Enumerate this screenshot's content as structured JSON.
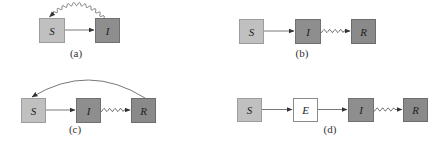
{
  "colors": {
    "susceptible_fill": "#c0c0c0",
    "susceptible_stroke": "#9c9c9c",
    "infected_fill": "#8e8e8e",
    "infected_stroke": "#707070",
    "recovered_fill": "#8a8a8a",
    "recovered_stroke": "#6c6c6c",
    "exposed_fill": "#ffffff",
    "exposed_stroke": "#8a8a8a",
    "edge": "#555555"
  },
  "panels": [
    {
      "id": "a",
      "caption": "(a)",
      "caption_pos": [
        76,
        57
      ],
      "nodes": [
        {
          "id": "S",
          "label": "S",
          "type": "susceptible",
          "x": 39,
          "y": 18,
          "w": 25,
          "h": 24
        },
        {
          "id": "I",
          "label": "I",
          "type": "infected",
          "x": 95,
          "y": 18,
          "w": 24,
          "h": 24
        }
      ],
      "edges": [
        {
          "from": "S",
          "to": "I",
          "style": "straight"
        },
        {
          "from": "I",
          "to": "S",
          "style": "wavy-arc",
          "peak_y": 4
        }
      ]
    },
    {
      "id": "b",
      "caption": "(b)",
      "caption_pos": [
        302,
        57
      ],
      "nodes": [
        {
          "id": "S",
          "label": "S",
          "type": "susceptible",
          "x": 239,
          "y": 19,
          "w": 24,
          "h": 24
        },
        {
          "id": "I",
          "label": "I",
          "type": "infected",
          "x": 295,
          "y": 19,
          "w": 25,
          "h": 24
        },
        {
          "id": "R",
          "label": "R",
          "type": "recovered",
          "x": 351,
          "y": 19,
          "w": 24,
          "h": 24
        }
      ],
      "edges": [
        {
          "from": "S",
          "to": "I",
          "style": "straight"
        },
        {
          "from": "I",
          "to": "R",
          "style": "wavy"
        }
      ]
    },
    {
      "id": "c",
      "caption": "(c)",
      "caption_pos": [
        75,
        133
      ],
      "nodes": [
        {
          "id": "S",
          "label": "S",
          "type": "susceptible",
          "x": 21,
          "y": 98,
          "w": 24,
          "h": 24
        },
        {
          "id": "I",
          "label": "I",
          "type": "infected",
          "x": 76,
          "y": 98,
          "w": 24,
          "h": 24
        },
        {
          "id": "R",
          "label": "R",
          "type": "recovered",
          "x": 131,
          "y": 98,
          "w": 24,
          "h": 24
        }
      ],
      "edges": [
        {
          "from": "S",
          "to": "I",
          "style": "straight"
        },
        {
          "from": "I",
          "to": "R",
          "style": "wavy"
        },
        {
          "from": "R",
          "to": "S",
          "style": "arc",
          "peak_y": 80
        }
      ]
    },
    {
      "id": "d",
      "caption": "(d)",
      "caption_pos": [
        330,
        133
      ],
      "nodes": [
        {
          "id": "S",
          "label": "S",
          "type": "susceptible",
          "x": 237,
          "y": 98,
          "w": 24,
          "h": 23
        },
        {
          "id": "E",
          "label": "E",
          "type": "exposed",
          "x": 293,
          "y": 98,
          "w": 24,
          "h": 23
        },
        {
          "id": "I",
          "label": "I",
          "type": "infected",
          "x": 348,
          "y": 98,
          "w": 25,
          "h": 23
        },
        {
          "id": "R",
          "label": "R",
          "type": "recovered",
          "x": 403,
          "y": 98,
          "w": 24,
          "h": 23
        }
      ],
      "edges": [
        {
          "from": "S",
          "to": "E",
          "style": "straight"
        },
        {
          "from": "E",
          "to": "I",
          "style": "straight"
        },
        {
          "from": "I",
          "to": "R",
          "style": "wavy"
        }
      ]
    }
  ]
}
